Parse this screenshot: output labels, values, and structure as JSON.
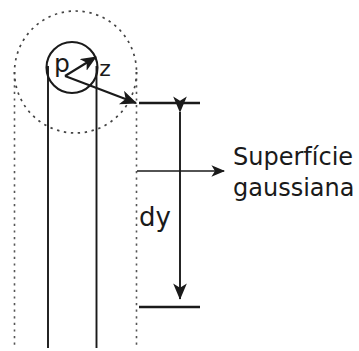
{
  "figure": {
    "domain": "diagram",
    "background_color": "#ffffff",
    "stroke_color": "#1a1a1a",
    "labels": {
      "charge_density": "p",
      "radial_distance": "z",
      "height_element": "dy",
      "gaussian_surface_line1": "Superfície",
      "gaussian_surface_line2": "gaussiana"
    },
    "elements": {
      "outer_dotted_circle": "dashed-circle",
      "inner_solid_circle": "solid-circle",
      "radial_arrow_short": "z-arrow",
      "radial_arrow_long": "radius-arrow",
      "pointer_arrow": "gaussian-surface-pointer",
      "dimension_arrow": "dy-dimension-arrow",
      "top_tick": "top-tick-mark",
      "bottom_tick": "bottom-tick-mark",
      "wire_left_edge": "wire-left-line",
      "wire_right_edge": "wire-right-line",
      "cylinder_left_edge": "cylinder-left-dotted-line",
      "cylinder_right_edge": "cylinder-right-dotted-line"
    }
  }
}
